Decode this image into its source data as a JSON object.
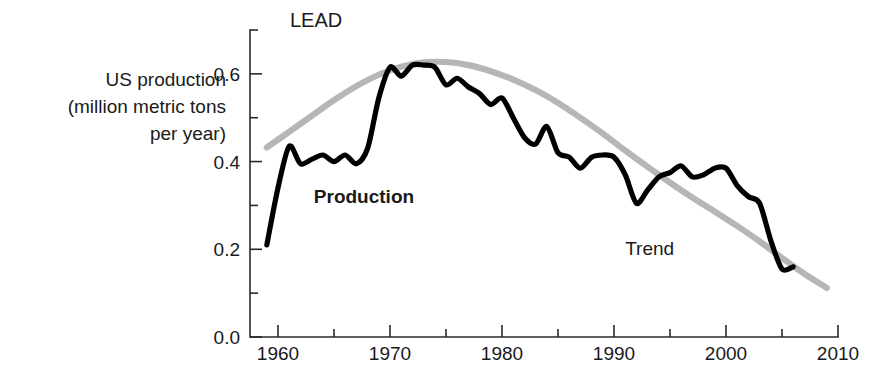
{
  "chart_data": {
    "type": "line",
    "title": "LEAD",
    "xlabel": "",
    "ylabel": "US production (million metric tons per year)",
    "ylabel_lines": [
      "US production",
      "(million metric tons",
      "per year)"
    ],
    "xlim": [
      1957.5,
      2010
    ],
    "ylim": [
      0.0,
      0.7
    ],
    "grid": false,
    "legend_position": "inline-annotations",
    "x_ticks_major": [
      1960,
      1970,
      1980,
      1990,
      2000,
      2010
    ],
    "x_tick_labels": [
      "1960",
      "1970",
      "1980",
      "1990",
      "2000",
      "2010"
    ],
    "x_ticks_minor": [
      1965,
      1975,
      1985,
      1995,
      2005
    ],
    "y_ticks_major": [
      0.0,
      0.2,
      0.4,
      0.6
    ],
    "y_tick_labels": [
      "0.0",
      "0.2",
      "0.4",
      "0.6"
    ],
    "y_ticks_minor": [
      0.1,
      0.3,
      0.5,
      0.7
    ],
    "annotations": [
      {
        "name": "production-label",
        "text": "Production",
        "x": 1963.2,
        "y": 0.305,
        "bold": true
      },
      {
        "name": "trend-label",
        "text": "Trend",
        "x": 1991.0,
        "y": 0.188,
        "bold": false
      }
    ],
    "series": [
      {
        "name": "Production",
        "color": "#000000",
        "x": [
          1959,
          1960,
          1961,
          1962,
          1963,
          1964,
          1965,
          1966,
          1967,
          1968,
          1969,
          1970,
          1971,
          1972,
          1973,
          1974,
          1975,
          1976,
          1977,
          1978,
          1979,
          1980,
          1981,
          1982,
          1983,
          1984,
          1985,
          1986,
          1987,
          1988,
          1989,
          1990,
          1991,
          1992,
          1993,
          1994,
          1995,
          1996,
          1997,
          1998,
          1999,
          2000,
          2001,
          2002,
          2003,
          2004,
          2005,
          2006
        ],
        "values": [
          0.21,
          0.34,
          0.435,
          0.395,
          0.405,
          0.415,
          0.4,
          0.415,
          0.395,
          0.43,
          0.545,
          0.615,
          0.595,
          0.62,
          0.62,
          0.615,
          0.575,
          0.59,
          0.57,
          0.555,
          0.53,
          0.545,
          0.5,
          0.455,
          0.44,
          0.48,
          0.42,
          0.41,
          0.385,
          0.41,
          0.415,
          0.41,
          0.37,
          0.305,
          0.335,
          0.365,
          0.375,
          0.39,
          0.365,
          0.37,
          0.385,
          0.385,
          0.345,
          0.32,
          0.305,
          0.22,
          0.155,
          0.16
        ]
      },
      {
        "name": "Trend",
        "color": "#b6b6b6",
        "x": [
          1959,
          1961,
          1963,
          1965,
          1967,
          1969,
          1971,
          1973,
          1975,
          1977,
          1979,
          1981,
          1983,
          1985,
          1987,
          1989,
          1991,
          1993,
          1995,
          1997,
          1999,
          2001,
          2003,
          2005,
          2007,
          2009
        ],
        "values": [
          0.432,
          0.468,
          0.504,
          0.54,
          0.572,
          0.598,
          0.616,
          0.626,
          0.627,
          0.62,
          0.606,
          0.587,
          0.563,
          0.534,
          0.5,
          0.464,
          0.425,
          0.388,
          0.352,
          0.318,
          0.286,
          0.253,
          0.218,
          0.18,
          0.144,
          0.112
        ]
      }
    ]
  },
  "layout": {
    "plot_left_px": 250,
    "plot_right_px": 838,
    "plot_top_px": 30,
    "plot_bottom_px": 337,
    "x_min": 1957.5,
    "x_max": 2010,
    "y_min": 0.0,
    "y_max": 0.7
  }
}
